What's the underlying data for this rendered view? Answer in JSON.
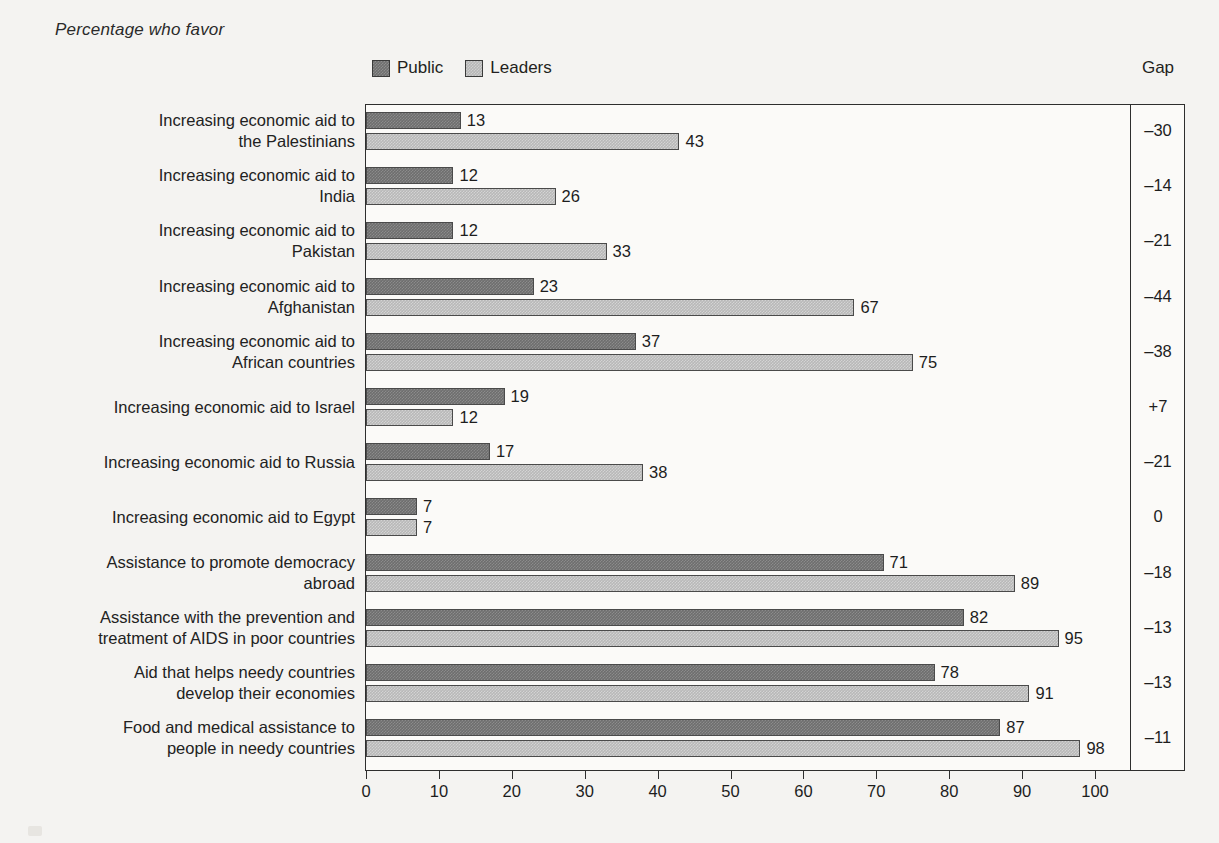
{
  "title": "Percentage who favor",
  "legend": {
    "position": "top",
    "items": [
      {
        "label": "Public",
        "color": "#6e6e6e",
        "icon": "legend-swatch"
      },
      {
        "label": "Leaders",
        "color": "#b8b8b8",
        "icon": "legend-swatch"
      }
    ]
  },
  "gap_column": {
    "header": "Gap"
  },
  "axis": {
    "ticks": [
      "0",
      "10",
      "20",
      "30",
      "40",
      "50",
      "60",
      "70",
      "80",
      "90",
      "100"
    ]
  },
  "chart_data": {
    "type": "bar",
    "orientation": "horizontal",
    "title": "Percentage who favor",
    "xlabel": "",
    "ylabel": "",
    "xlim": [
      0,
      100
    ],
    "xticks": [
      0,
      10,
      20,
      30,
      40,
      50,
      60,
      70,
      80,
      90,
      100
    ],
    "grid": false,
    "legend_position": "top",
    "categories": [
      "Increasing economic aid to\nthe Palestinians",
      "Increasing economic aid to\nIndia",
      "Increasing economic aid to\nPakistan",
      "Increasing economic aid to\nAfghanistan",
      "Increasing economic aid to\nAfrican countries",
      "Increasing economic aid to Israel",
      "Increasing economic aid to Russia",
      "Increasing economic aid to Egypt",
      "Assistance to promote democracy\nabroad",
      "Assistance with the prevention and\ntreatment of AIDS in poor countries",
      "Aid that helps needy countries\ndevelop their economies",
      "Food and medical assistance to\npeople in needy countries"
    ],
    "series": [
      {
        "name": "Public",
        "color": "#6e6e6e",
        "values": [
          13,
          12,
          12,
          23,
          37,
          19,
          17,
          7,
          71,
          82,
          78,
          87
        ]
      },
      {
        "name": "Leaders",
        "color": "#b8b8b8",
        "values": [
          43,
          26,
          33,
          67,
          75,
          12,
          38,
          7,
          89,
          95,
          91,
          98
        ]
      }
    ],
    "gap": [
      "–30",
      "–14",
      "–21",
      "–44",
      "–38",
      "+7",
      "–21",
      "0",
      "–18",
      "–13",
      "–13",
      "–11"
    ]
  }
}
